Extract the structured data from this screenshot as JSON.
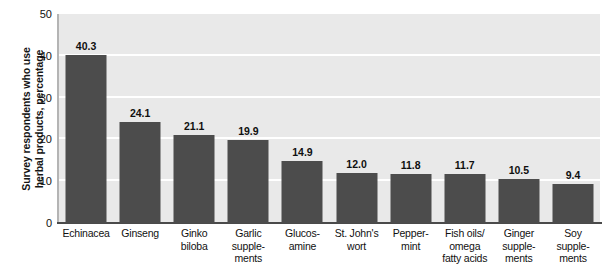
{
  "chart_data": {
    "type": "bar",
    "title": "",
    "subtitle": "",
    "xlabel": "",
    "ylabel": "Survey respondents who use\nherbal products, percentage",
    "ylim": [
      0,
      50
    ],
    "ytick_values": [
      50,
      40,
      30,
      20,
      10,
      0
    ],
    "ytick_labels": [
      "50",
      "40",
      "30",
      "20",
      "10",
      "0"
    ],
    "grid": "horizontal",
    "legend": "none",
    "categories": [
      "Echinacea",
      "Ginseng",
      "Ginko\nbiloba",
      "Garlic\nsupple-\nments",
      "Glucos-\namine",
      "St. John's\nwort",
      "Pepper-\nmint",
      "Fish oils/\nomega\nfatty acids",
      "Ginger\nsupple-\nments",
      "Soy\nsupple-\nments"
    ],
    "values": [
      40.3,
      24.1,
      21.1,
      19.9,
      14.9,
      12.0,
      11.8,
      11.7,
      10.5,
      9.4
    ],
    "value_labels": [
      "40.3",
      "24.1",
      "21.1",
      "19.9",
      "14.9",
      "12.0",
      "11.8",
      "11.7",
      "10.5",
      "9.4"
    ],
    "colors": {
      "bar": "#4c4c4c",
      "plot_background": "#e9e9e9",
      "gridline": "#ffffff",
      "axis": "#4a4a4a",
      "text": "#111111",
      "page_background": "#ffffff"
    }
  }
}
